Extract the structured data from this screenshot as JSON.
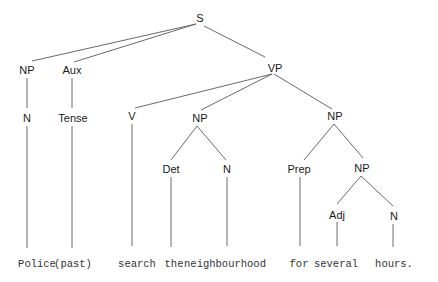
{
  "diagram": {
    "type": "syntax-tree",
    "colors": {
      "edge": "#6a6a6a",
      "label": "#1a1a1a",
      "word": "#333333",
      "background": "#ffffff"
    },
    "nodes": [
      {
        "id": "S",
        "label": "S",
        "x": 200,
        "y": 22
      },
      {
        "id": "NP1",
        "label": "NP",
        "x": 27,
        "y": 74
      },
      {
        "id": "AUX",
        "label": "Aux",
        "x": 72,
        "y": 74
      },
      {
        "id": "VP",
        "label": "VP",
        "x": 275,
        "y": 72
      },
      {
        "id": "N1",
        "label": "N",
        "x": 27,
        "y": 122
      },
      {
        "id": "TENSE",
        "label": "Tense",
        "x": 73,
        "y": 122
      },
      {
        "id": "V",
        "label": "V",
        "x": 132,
        "y": 120
      },
      {
        "id": "NP2",
        "label": "NP",
        "x": 200,
        "y": 122
      },
      {
        "id": "NP3",
        "label": "NP",
        "x": 335,
        "y": 120
      },
      {
        "id": "DET",
        "label": "Det",
        "x": 171,
        "y": 173
      },
      {
        "id": "N2",
        "label": "N",
        "x": 227,
        "y": 173
      },
      {
        "id": "PREP",
        "label": "Prep",
        "x": 299,
        "y": 173
      },
      {
        "id": "NP4",
        "label": "NP",
        "x": 362,
        "y": 172
      },
      {
        "id": "ADJ",
        "label": "Adj",
        "x": 337,
        "y": 219
      },
      {
        "id": "N3",
        "label": "N",
        "x": 394,
        "y": 220
      }
    ],
    "words": [
      {
        "id": "w1",
        "text": "Police",
        "x": 37,
        "y": 267
      },
      {
        "id": "w2",
        "text": "(past)",
        "x": 73,
        "y": 267
      },
      {
        "id": "w3",
        "text": "search",
        "x": 137,
        "y": 267
      },
      {
        "id": "w4",
        "text": "the",
        "x": 174,
        "y": 267
      },
      {
        "id": "w5",
        "text": "neighbourhood",
        "x": 225,
        "y": 267
      },
      {
        "id": "w6",
        "text": "for",
        "x": 299,
        "y": 267
      },
      {
        "id": "w7",
        "text": "several",
        "x": 336,
        "y": 267
      },
      {
        "id": "w8",
        "text": "hours.",
        "x": 394,
        "y": 267
      }
    ],
    "edges": [
      {
        "x1": 196,
        "y1": 24,
        "x2": 32,
        "y2": 61
      },
      {
        "x1": 196,
        "y1": 24,
        "x2": 74,
        "y2": 62
      },
      {
        "x1": 204,
        "y1": 26,
        "x2": 265,
        "y2": 57
      },
      {
        "x1": 27,
        "y1": 78,
        "x2": 27,
        "y2": 108
      },
      {
        "x1": 72,
        "y1": 78,
        "x2": 72,
        "y2": 108
      },
      {
        "x1": 272,
        "y1": 74,
        "x2": 135,
        "y2": 108
      },
      {
        "x1": 272,
        "y1": 74,
        "x2": 201,
        "y2": 110
      },
      {
        "x1": 274,
        "y1": 74,
        "x2": 332,
        "y2": 109
      },
      {
        "x1": 27,
        "y1": 126,
        "x2": 27,
        "y2": 248
      },
      {
        "x1": 72,
        "y1": 126,
        "x2": 72,
        "y2": 248
      },
      {
        "x1": 132,
        "y1": 124,
        "x2": 132,
        "y2": 246
      },
      {
        "x1": 197,
        "y1": 126,
        "x2": 171,
        "y2": 160
      },
      {
        "x1": 197,
        "y1": 126,
        "x2": 226,
        "y2": 160
      },
      {
        "x1": 334,
        "y1": 124,
        "x2": 304,
        "y2": 160
      },
      {
        "x1": 334,
        "y1": 124,
        "x2": 363,
        "y2": 158
      },
      {
        "x1": 171,
        "y1": 177,
        "x2": 171,
        "y2": 247
      },
      {
        "x1": 227,
        "y1": 177,
        "x2": 227,
        "y2": 246
      },
      {
        "x1": 300,
        "y1": 177,
        "x2": 300,
        "y2": 246
      },
      {
        "x1": 361,
        "y1": 176,
        "x2": 337,
        "y2": 204
      },
      {
        "x1": 361,
        "y1": 176,
        "x2": 393,
        "y2": 206
      },
      {
        "x1": 337,
        "y1": 222,
        "x2": 337,
        "y2": 246
      },
      {
        "x1": 393,
        "y1": 224,
        "x2": 393,
        "y2": 247
      }
    ]
  }
}
